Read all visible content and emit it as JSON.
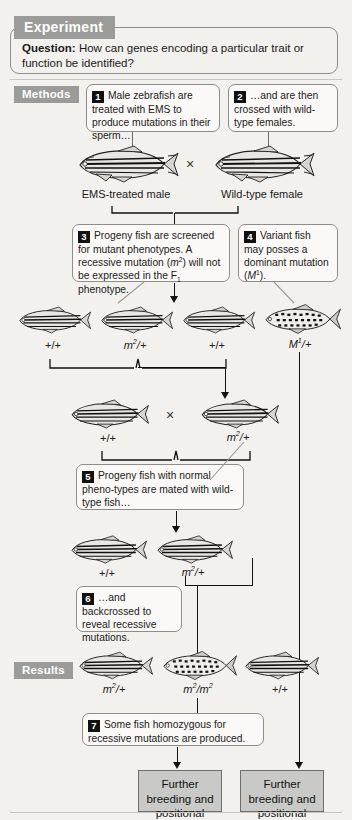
{
  "figure": {
    "header_tag": "Experiment",
    "question_label": "Question:",
    "question_text": "How can genes encoding a particular trait or function be identified?",
    "methods_tag": "Methods",
    "results_tag": "Results"
  },
  "steps": [
    {
      "num": "1",
      "text": "Male zebrafish are treated with EMS to produce mutations in their sperm…"
    },
    {
      "num": "2",
      "text": "…and are then crossed with wild-type females."
    },
    {
      "num": "3",
      "text": "Progeny fish are screened for mutant phenotypes. A recessive mutation (m2) will not be expressed in the F1 phenotype."
    },
    {
      "num": "4",
      "text": "Variant fish may posses a dominant mutation (M1)."
    },
    {
      "num": "5",
      "text": "Progeny fish with normal pheno-types are mated with wild-type fish…"
    },
    {
      "num": "6",
      "text": "…and backcrossed to reveal recessive mutations."
    },
    {
      "num": "7",
      "text": "Some fish homozygous for recessive mutations are produced."
    }
  ],
  "parents": {
    "male_label": "EMS-treated male",
    "female_label": "Wild-type female",
    "cross_symbol": "×"
  },
  "f1_genotypes": [
    "+/+",
    "m2/+",
    "+/+",
    "M1/+"
  ],
  "cross2_genotypes": [
    "+/+",
    "m2/+"
  ],
  "cross2_symbol": "×",
  "f2_genotypes": [
    "+/+",
    "m2/+"
  ],
  "result_genotypes": [
    "m2/+",
    "m2/m2",
    "+/+"
  ],
  "outcome_boxes": [
    "Further breeding and positional cloning",
    "Further breeding and positional cloning"
  ],
  "colors": {
    "page_background": "#f3f1ee",
    "tag_gray": "#9b9b99",
    "box_border": "#8d8d8b",
    "callout_fill": "#faf9f7",
    "result_box_fill": "#c9c9c7",
    "ink": "#111111"
  }
}
